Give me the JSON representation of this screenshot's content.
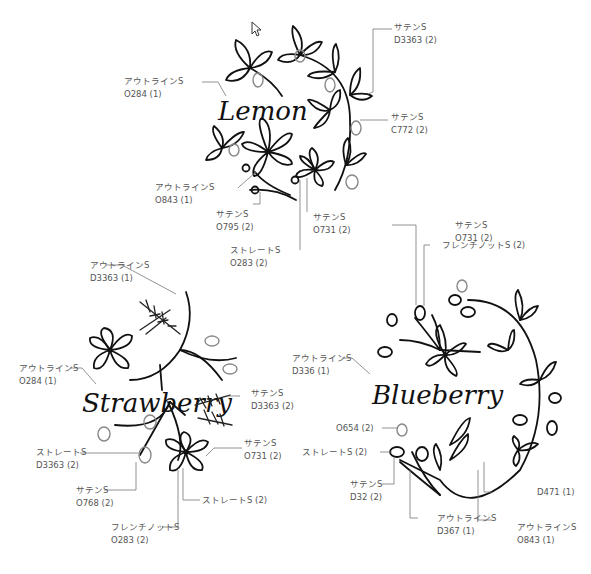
{
  "motifs": {
    "lemon": {
      "title": "Lemon",
      "callouts": [
        {
          "stitch": "サテンS",
          "thread": "D3363 (2)"
        },
        {
          "stitch": "アウトラインS",
          "thread": "O284 (1)"
        },
        {
          "stitch": "サテンS",
          "thread": "C772 (2)"
        },
        {
          "stitch": "アウトラインS",
          "thread": "O843 (1)"
        },
        {
          "stitch": "サテンS",
          "thread": "O795 (2)"
        },
        {
          "stitch": "サテンS",
          "thread": "O731 (2)"
        },
        {
          "stitch": "ストレートS",
          "thread": "O283 (2)"
        }
      ]
    },
    "strawberry": {
      "title": "Strawberry",
      "callouts": [
        {
          "stitch": "アウトラインS",
          "thread": "D3363 (1)"
        },
        {
          "stitch": "アウトラインS",
          "thread": "O284 (1)"
        },
        {
          "stitch": "サテンS",
          "thread": "D3363 (2)"
        },
        {
          "stitch": "サテンS",
          "thread": "O731 (2)"
        },
        {
          "stitch": "ストレートS",
          "thread": "D3363 (2)"
        },
        {
          "stitch": "サテンS",
          "thread": "O768 (2)"
        },
        {
          "stitch": "ストレートS (2)",
          "thread": ""
        },
        {
          "stitch": "フレンチノットS",
          "thread": "O283 (2)"
        }
      ]
    },
    "blueberry": {
      "title": "Blueberry",
      "callouts": [
        {
          "stitch": "サテンS",
          "thread": "O731 (2)"
        },
        {
          "stitch": "フレンチノットS (2)",
          "thread": ""
        },
        {
          "stitch": "アウトラインS",
          "thread": "D336 (1)"
        },
        {
          "stitch": "O654 (2)",
          "thread": ""
        },
        {
          "stitch": "ストレートS (2)",
          "thread": ""
        },
        {
          "stitch": "サテンS",
          "thread": "D32 (2)"
        },
        {
          "stitch": "D471 (1)",
          "thread": ""
        },
        {
          "stitch": "アウトラインS",
          "thread": "D367 (1)"
        },
        {
          "stitch": "アウトラインS",
          "thread": "O843 (1)"
        }
      ]
    }
  }
}
